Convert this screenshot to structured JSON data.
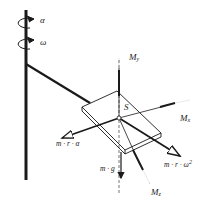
{
  "diagram": {
    "title": "",
    "labels": {
      "alpha": "α",
      "omega": "ω",
      "center": "S",
      "moment_y": {
        "base": "M",
        "sub": "y"
      },
      "moment_x": {
        "base": "M",
        "sub": "x"
      },
      "moment_z": {
        "base": "M",
        "sub": "z"
      },
      "tangential_force": "m · r · α",
      "centripetal_force": {
        "base": "m · r · ω",
        "sup": "2"
      },
      "gravity_force": "m · g"
    },
    "colors": {
      "line": "#1a1a1a",
      "background": "#ffffff"
    }
  }
}
